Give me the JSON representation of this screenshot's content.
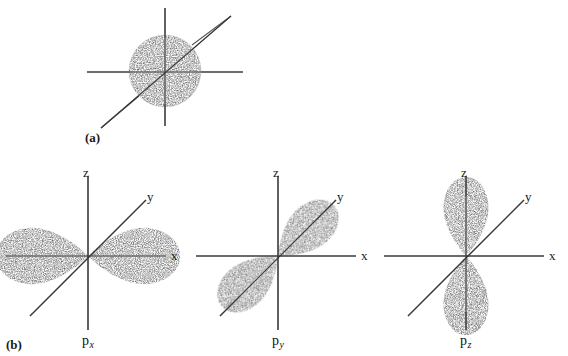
{
  "figure": {
    "background_color": "#ffffff",
    "ink_color": "#1a1a1a",
    "panels": [
      {
        "caption": "(a)",
        "orbital": "s",
        "description": "spherical s orbital with three intersecting axes"
      },
      {
        "caption": "(b)",
        "orbital": "p",
        "description": "three p orbitals px, py and pz with labelled x, y, z axes"
      }
    ]
  },
  "panel_a": {
    "caption": "(a)",
    "center": {
      "x": 165,
      "y": 71
    },
    "sphere_radius": 36
  },
  "panel_b": {
    "caption": "(b)",
    "diagrams": [
      {
        "name": "px",
        "label_main": "p",
        "label_sub": "x",
        "origin": {
          "x": 88,
          "y": 256
        },
        "axes": [
          {
            "name": "z",
            "label": "z",
            "label_x": 83,
            "label_y": 166
          },
          {
            "name": "y",
            "label": "y",
            "label_x": 147,
            "label_y": 190
          },
          {
            "name": "x",
            "label": "x",
            "label_x": 171,
            "label_y": 249
          }
        ],
        "lobe_orientation": "horizontal"
      },
      {
        "name": "py",
        "label_main": "p",
        "label_sub": "y",
        "origin": {
          "x": 278,
          "y": 256
        },
        "axes": [
          {
            "name": "z",
            "label": "z",
            "label_x": 273,
            "label_y": 166
          },
          {
            "name": "y",
            "label": "y",
            "label_x": 337,
            "label_y": 190
          },
          {
            "name": "x",
            "label": "x",
            "label_x": 361,
            "label_y": 249
          }
        ],
        "lobe_orientation": "diagonal"
      },
      {
        "name": "pz",
        "label_main": "p",
        "label_sub": "z",
        "origin": {
          "x": 466,
          "y": 256
        },
        "axes": [
          {
            "name": "z",
            "label": "z",
            "label_x": 461,
            "label_y": 166
          },
          {
            "name": "y",
            "label": "y",
            "label_x": 525,
            "label_y": 190
          },
          {
            "name": "x",
            "label": "x",
            "label_x": 549,
            "label_y": 249
          }
        ],
        "lobe_orientation": "vertical"
      }
    ],
    "orbital_labels": [
      {
        "main": "p",
        "sub": "x",
        "x": 82,
        "y": 334
      },
      {
        "main": "p",
        "sub": "y",
        "x": 272,
        "y": 334
      },
      {
        "main": "p",
        "sub": "z",
        "x": 460,
        "y": 334
      }
    ]
  }
}
